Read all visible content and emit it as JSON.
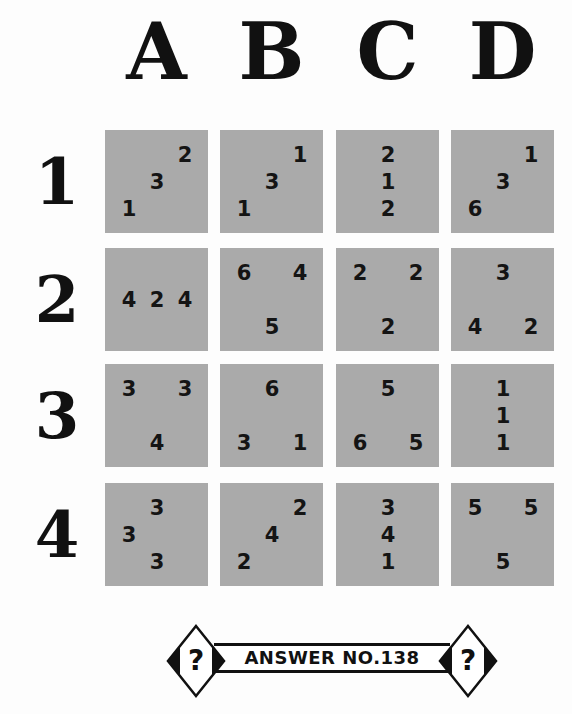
{
  "puzzle": {
    "column_labels": [
      "A",
      "B",
      "C",
      "D"
    ],
    "row_labels": [
      "1",
      "2",
      "3",
      "4"
    ],
    "cell_color": "#aaaaaa",
    "grid": [
      [
        {
          "id": "A1",
          "digits": [
            {
              "v": "2",
              "r": 0,
              "c": 2
            },
            {
              "v": "3",
              "r": 1,
              "c": 1
            },
            {
              "v": "1",
              "r": 2,
              "c": 0
            }
          ]
        },
        {
          "id": "B1",
          "digits": [
            {
              "v": "1",
              "r": 0,
              "c": 2
            },
            {
              "v": "3",
              "r": 1,
              "c": 1
            },
            {
              "v": "1",
              "r": 2,
              "c": 0
            }
          ]
        },
        {
          "id": "C1",
          "digits": [
            {
              "v": "2",
              "r": 0,
              "c": 1
            },
            {
              "v": "1",
              "r": 1,
              "c": 1
            },
            {
              "v": "2",
              "r": 2,
              "c": 1
            }
          ]
        },
        {
          "id": "D1",
          "digits": [
            {
              "v": "1",
              "r": 0,
              "c": 2
            },
            {
              "v": "3",
              "r": 1,
              "c": 1
            },
            {
              "v": "6",
              "r": 2,
              "c": 0
            }
          ]
        }
      ],
      [
        {
          "id": "A2",
          "digits": [
            {
              "v": "4",
              "r": 1,
              "c": 0
            },
            {
              "v": "2",
              "r": 1,
              "c": 1
            },
            {
              "v": "4",
              "r": 1,
              "c": 2
            }
          ]
        },
        {
          "id": "B2",
          "digits": [
            {
              "v": "6",
              "r": 0,
              "c": 0
            },
            {
              "v": "4",
              "r": 0,
              "c": 2
            },
            {
              "v": "5",
              "r": 2,
              "c": 1
            }
          ]
        },
        {
          "id": "C2",
          "digits": [
            {
              "v": "2",
              "r": 0,
              "c": 0
            },
            {
              "v": "2",
              "r": 0,
              "c": 2
            },
            {
              "v": "2",
              "r": 2,
              "c": 1
            }
          ]
        },
        {
          "id": "D2",
          "digits": [
            {
              "v": "3",
              "r": 0,
              "c": 1
            },
            {
              "v": "4",
              "r": 2,
              "c": 0
            },
            {
              "v": "2",
              "r": 2,
              "c": 2
            }
          ]
        }
      ],
      [
        {
          "id": "A3",
          "digits": [
            {
              "v": "3",
              "r": 0,
              "c": 0
            },
            {
              "v": "3",
              "r": 0,
              "c": 2
            },
            {
              "v": "4",
              "r": 2,
              "c": 1
            }
          ]
        },
        {
          "id": "B3",
          "digits": [
            {
              "v": "6",
              "r": 0,
              "c": 1
            },
            {
              "v": "3",
              "r": 2,
              "c": 0
            },
            {
              "v": "1",
              "r": 2,
              "c": 2
            }
          ]
        },
        {
          "id": "C3",
          "digits": [
            {
              "v": "5",
              "r": 0,
              "c": 1
            },
            {
              "v": "6",
              "r": 2,
              "c": 0
            },
            {
              "v": "5",
              "r": 2,
              "c": 2
            }
          ]
        },
        {
          "id": "D3",
          "digits": [
            {
              "v": "1",
              "r": 0,
              "c": 1
            },
            {
              "v": "1",
              "r": 1,
              "c": 1
            },
            {
              "v": "1",
              "r": 2,
              "c": 1
            }
          ]
        }
      ],
      [
        {
          "id": "A4",
          "digits": [
            {
              "v": "3",
              "r": 0,
              "c": 1
            },
            {
              "v": "3",
              "r": 1,
              "c": 0
            },
            {
              "v": "3",
              "r": 2,
              "c": 1
            }
          ]
        },
        {
          "id": "B4",
          "digits": [
            {
              "v": "2",
              "r": 0,
              "c": 2
            },
            {
              "v": "4",
              "r": 1,
              "c": 1
            },
            {
              "v": "2",
              "r": 2,
              "c": 0
            }
          ]
        },
        {
          "id": "C4",
          "digits": [
            {
              "v": "3",
              "r": 0,
              "c": 1
            },
            {
              "v": "4",
              "r": 1,
              "c": 1
            },
            {
              "v": "1",
              "r": 2,
              "c": 1
            }
          ]
        },
        {
          "id": "D4",
          "digits": [
            {
              "v": "5",
              "r": 0,
              "c": 0
            },
            {
              "v": "5",
              "r": 0,
              "c": 2
            },
            {
              "v": "5",
              "r": 2,
              "c": 1
            }
          ]
        }
      ]
    ]
  },
  "answer_banner": {
    "label": "ANSWER NO.138",
    "icon_glyph": "?"
  }
}
